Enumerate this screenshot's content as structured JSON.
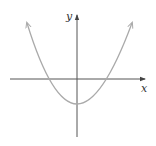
{
  "diagram": {
    "type": "function-graph",
    "axes": {
      "x_label": "x",
      "y_label": "y",
      "axis_color": "#555555"
    },
    "curve": {
      "shape": "parabola",
      "opens": "up",
      "color": "#aaaaaa",
      "vertex_px": [
        77,
        104
      ],
      "x_intercepts_px": [
        47,
        113
      ],
      "ends_px": [
        [
          27,
          23
        ],
        [
          132,
          23
        ]
      ]
    }
  }
}
